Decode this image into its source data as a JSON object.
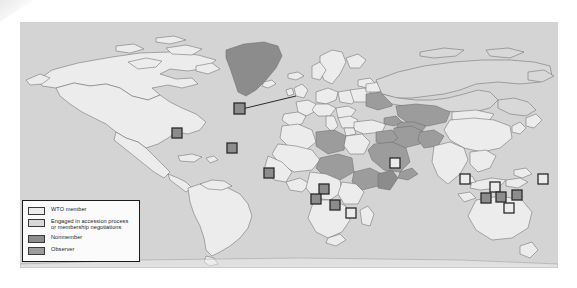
{
  "figure": {
    "panel": {
      "ocean_color": "#d4d4d4",
      "border_color": "#b9b9b9"
    }
  },
  "legend": {
    "name": "map-legend",
    "box_bg": "#fbfbfb",
    "box_border": "#1b1b1b",
    "items": [
      {
        "key": "wto-member",
        "label": "WTO member",
        "color": "#ececec",
        "border": "#3a3a3a"
      },
      {
        "key": "accession",
        "label": "Engaged in accession process\nor membership negotiations",
        "color": "#d8d8d8",
        "border": "#3a3a3a"
      },
      {
        "key": "nonmember",
        "label": "Nonmember",
        "color": "#8c8c8c",
        "border": "#3a3a3a"
      },
      {
        "key": "observer",
        "label": "Observer",
        "color": "#9c9c9c",
        "border": "#3a3a3a"
      }
    ]
  },
  "map_data": {
    "type": "choropleth",
    "projection": "world-equirectangular",
    "categories": [
      "WTO member",
      "Engaged in accession process or membership negotiations",
      "Nonmember",
      "Observer"
    ],
    "category_colors": {
      "WTO member": "#ececec",
      "Engaged in accession process or membership negotiations": "#d8d8d8",
      "Nonmember": "#8c8c8c",
      "Observer": "#9c9c9c"
    },
    "outline_color": "#6e6e6e",
    "regions": [
      {
        "name": "Canada",
        "category": "WTO member"
      },
      {
        "name": "United States",
        "category": "WTO member"
      },
      {
        "name": "Mexico",
        "category": "WTO member"
      },
      {
        "name": "Greenland",
        "category": "Nonmember"
      },
      {
        "name": "Brazil",
        "category": "WTO member"
      },
      {
        "name": "Argentina",
        "category": "WTO member"
      },
      {
        "name": "Western Europe",
        "category": "WTO member"
      },
      {
        "name": "Russia",
        "category": "Engaged in accession process or membership negotiations"
      },
      {
        "name": "Ukraine",
        "category": "Observer"
      },
      {
        "name": "Kazakhstan",
        "category": "Observer"
      },
      {
        "name": "China",
        "category": "WTO member"
      },
      {
        "name": "India",
        "category": "WTO member"
      },
      {
        "name": "Saudi Arabia",
        "category": "Observer"
      },
      {
        "name": "Iran",
        "category": "Observer"
      },
      {
        "name": "Iraq",
        "category": "Observer"
      },
      {
        "name": "Libya",
        "category": "Observer"
      },
      {
        "name": "Sudan",
        "category": "Observer"
      },
      {
        "name": "Ethiopia",
        "category": "Observer"
      },
      {
        "name": "Somalia",
        "category": "Nonmember"
      },
      {
        "name": "Afghanistan",
        "category": "Observer"
      },
      {
        "name": "Australia",
        "category": "WTO member"
      },
      {
        "name": "Pacific islands",
        "category": "Nonmember"
      }
    ],
    "markers": [
      {
        "name": "caribbean-marker",
        "x": 172,
        "y": 128,
        "category": "Nonmember"
      },
      {
        "name": "atlantic-marker",
        "x": 227,
        "y": 143,
        "category": "Nonmember"
      },
      {
        "name": "europe-callout-marker",
        "x": 234,
        "y": 104,
        "category": "Nonmember",
        "leader_to_x": 296,
        "leader_to_y": 93
      },
      {
        "name": "west-africa-marker",
        "x": 264,
        "y": 168,
        "category": "Nonmember"
      },
      {
        "name": "gulf-guinea-marker",
        "x": 327,
        "y": 184,
        "category": "Nonmember"
      },
      {
        "name": "indian-ocean-marker-1",
        "x": 319,
        "y": 194,
        "category": "Nonmember"
      },
      {
        "name": "indian-ocean-marker-2",
        "x": 337,
        "y": 199,
        "category": "Nonmember"
      },
      {
        "name": "indian-ocean-marker-3",
        "x": 353,
        "y": 207,
        "category": "WTO member"
      },
      {
        "name": "indian-ocean-marker-4",
        "x": 396,
        "y": 158,
        "category": "WTO member"
      },
      {
        "name": "pacific-marker-1",
        "x": 468,
        "y": 176,
        "category": "WTO member"
      },
      {
        "name": "pacific-marker-2",
        "x": 497,
        "y": 184,
        "category": "WTO member"
      },
      {
        "name": "pacific-marker-3",
        "x": 488,
        "y": 195,
        "category": "Nonmember"
      },
      {
        "name": "pacific-marker-4",
        "x": 503,
        "y": 194,
        "category": "Nonmember"
      },
      {
        "name": "pacific-marker-5",
        "x": 519,
        "y": 192,
        "category": "Nonmember"
      },
      {
        "name": "pacific-marker-6",
        "x": 511,
        "y": 205,
        "category": "WTO member"
      },
      {
        "name": "pacific-marker-7",
        "x": 545,
        "y": 176,
        "category": "WTO member"
      }
    ]
  }
}
